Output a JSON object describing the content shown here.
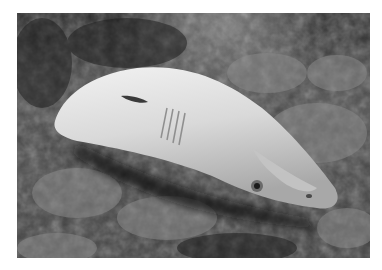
{
  "image": {
    "description": "Grayscale underwater photograph of a pale shark lying on its side on a coral rubble seabed",
    "subject": "shark",
    "setting": "coral reef seabed",
    "color_mode": "grayscale",
    "frame_color": "#ffffff",
    "tones": {
      "background_dark": "#1e1e1e",
      "water_top": "#4a4a4a",
      "coral_mid": "#7a7a7a",
      "shark_body": "#d8d8d8",
      "shark_highlight": "#eeeeee"
    }
  }
}
